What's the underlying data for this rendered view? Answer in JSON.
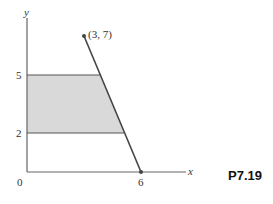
{
  "figure": {
    "id_label": "P7.19",
    "axes": {
      "x_label": "x",
      "y_label": "y",
      "origin_label": "0",
      "x_ticks": [
        "6"
      ],
      "y_ticks": [
        "2",
        "5"
      ]
    },
    "point_label": "(3, 7)",
    "shaded_region": {
      "description": "Region between y=2 and y=5, left of line through (3,7) and (6,0)",
      "fill": "#d9d9d9"
    },
    "line": {
      "from": [
        3,
        7
      ],
      "to": [
        6,
        0
      ]
    },
    "colors": {
      "axis": "#666666",
      "fill": "#d9d9d9",
      "stroke": "#555555"
    }
  }
}
